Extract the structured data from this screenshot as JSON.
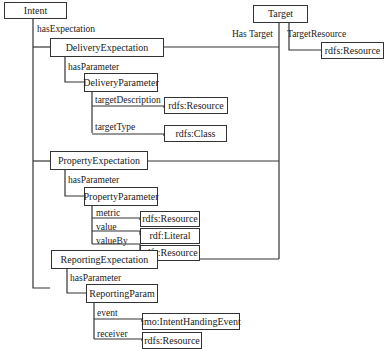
{
  "nodes": {
    "intent": "Intent",
    "target": "Target",
    "target_resource_type": "rdfs:Resource",
    "delivery_expectation": "DeliveryExpectation",
    "delivery_parameter": "DeliveryParameter",
    "target_description_type": "rdfs:Resource",
    "target_type_type": "rdfs:Class",
    "property_expectation": "PropertyExpectation",
    "property_parameter": "PropertyParameter",
    "metric_type": "rdfs:Resource",
    "value_type": "rdf:Literal",
    "value_by_type": "rdfs:Resource",
    "reporting_expectation": "ReportingExpectation",
    "reporting_param": "ReportingParam",
    "event_type": "imo:IntentHandingEvent",
    "receiver_type": "rdfs:Resource"
  },
  "edges": {
    "has_expectation": "hasExpectation",
    "has_target": "Has Target",
    "target_resource": "TargetResource",
    "delivery_has_parameter": "hasParameter",
    "target_description": "targetDescription",
    "target_type": "targetType",
    "property_has_parameter": "hasParameter",
    "metric": "metric",
    "value": "value",
    "value_by": "valueBy",
    "reporting_has_parameter": "hasParameter",
    "event": "event",
    "receiver": "receiver"
  }
}
